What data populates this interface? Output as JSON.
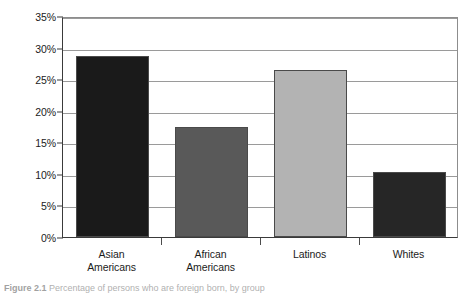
{
  "figure": {
    "caption_prefix": "Figure 2.1",
    "caption_text": "Percentage of persons who are foreign born, by group"
  },
  "chart_data": {
    "type": "bar",
    "title": "",
    "subtitle": "",
    "xlabel": "",
    "ylabel": "",
    "categories": [
      "Asian Americans",
      "African Americans",
      "Latinos",
      "Whites"
    ],
    "category_lines": [
      [
        "Asian",
        "Americans"
      ],
      [
        "African",
        "Americans"
      ],
      [
        "Latinos",
        ""
      ],
      [
        "Whites",
        ""
      ]
    ],
    "values": [
      28.7,
      17.5,
      26.4,
      10.3
    ],
    "value_labels": [
      "28.7%",
      "17.5%",
      "26.4%",
      "10.3%"
    ],
    "bar_colors": [
      "#1a1a1a",
      "#595959",
      "#b3b3b3",
      "#262626"
    ],
    "ylim": [
      0,
      35
    ],
    "ytick_values": [
      0,
      5,
      10,
      15,
      20,
      25,
      30,
      35
    ],
    "ytick_labels": [
      "0%",
      "5%",
      "10%",
      "15%",
      "20%",
      "25%",
      "30%",
      "35%"
    ],
    "grid": true,
    "grid_axis": "y",
    "legend": false,
    "legend_position": "none",
    "axis_line_color": "#3a3a3a",
    "grid_color": "#9a9a9a",
    "background_color": "#ffffff"
  }
}
